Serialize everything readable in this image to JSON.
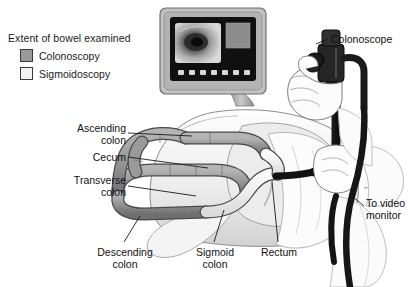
{
  "figure": {
    "kind": "medical-illustration",
    "background_color": "#ffffff"
  },
  "legend": {
    "title": "Extent of bowel examined",
    "items": [
      {
        "label": "Colonoscopy",
        "color": "#9a9a9a",
        "border": "#3a3a3a"
      },
      {
        "label": "Sigmoidoscopy",
        "color": "#f2f2f2",
        "border": "#3a3a3a"
      }
    ]
  },
  "labels": {
    "ascending_colon_line1": "Ascending",
    "ascending_colon_line2": "colon",
    "cecum": "Cecum",
    "transverse_colon_line1": "Transverse",
    "transverse_colon_line2": "colon",
    "colonoscope": "Colonoscope",
    "to_video_monitor_line1": "To video",
    "to_video_monitor_line2": "monitor",
    "descending_colon_line1": "Descending",
    "descending_colon_line2": "colon",
    "sigmoid_colon_line1": "Sigmoid",
    "sigmoid_colon_line2": "colon",
    "rectum": "Rectum"
  },
  "monitor": {
    "name": "video monitor",
    "bezel_color": "#b9b9b9",
    "screen_color": "#141414",
    "endoscopic_view_label": "endoscopic-image",
    "side_panel_color": "#8d8d8d",
    "button_count": 7,
    "button_color": "#d8d8d8"
  },
  "colors": {
    "colon_fill": "#9a9a9a",
    "colon_fill_light": "#efefef",
    "colon_outline": "#4a4a4a",
    "body_fill": "#f4f4f4",
    "body_shade": "#d6d6d6",
    "gown_fill": "#fbfbfb",
    "skin_fill": "#fafafa",
    "scope_dark": "#1c1c1c",
    "leader_line": "#1a1a1a",
    "text": "#111111"
  },
  "parts": {
    "colonoscope_head": "colonoscope-control-head",
    "operator_hand_upper": "hand-gripping-control-head",
    "operator_hand_lower": "hand-guiding-insertion-tube",
    "insertion_tube": "scope-insertion-tube",
    "umbilical_cable": "cable-to-video-monitor",
    "patient": "patient-lying-on-side"
  }
}
